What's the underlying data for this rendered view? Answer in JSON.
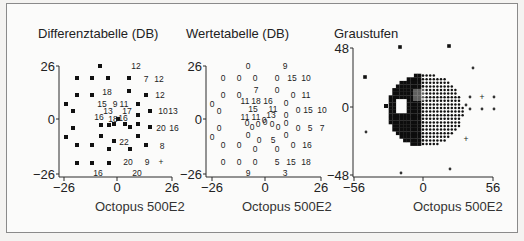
{
  "figure": {
    "panels": [
      {
        "title": "Differenztabelle (DB)",
        "footer": "Octopus 500E2"
      },
      {
        "title": "Wertetabelle (DB)",
        "footer": "Octopus 500E2"
      },
      {
        "title": "Graustufen",
        "footer": "Octopus 500E2"
      }
    ]
  },
  "chart_data": [
    {
      "type": "scatter",
      "title": "Differenztabelle (DB)",
      "xlabel": "Octopus 500E2",
      "ylabel": "",
      "xlim": [
        -26,
        26
      ],
      "ylim": [
        -26,
        26
      ],
      "x_ticks": [
        "-26",
        "0",
        "26"
      ],
      "y_ticks": [
        "26",
        "0",
        "-26"
      ],
      "grid": false,
      "legend": null,
      "description": "Perimetry difference table: filled squares mark points with defect symbols, numbers are deviation values in dB, '+' marks a point.",
      "labels": [
        {
          "text": "12",
          "px": 136,
          "py": 66
        },
        {
          "text": "7",
          "px": 146,
          "py": 79
        },
        {
          "text": "12",
          "px": 159,
          "py": 79
        },
        {
          "text": "18",
          "px": 107,
          "py": 92
        },
        {
          "text": "12",
          "px": 160,
          "py": 95
        },
        {
          "text": "15",
          "px": 102,
          "py": 104
        },
        {
          "text": "9",
          "px": 115,
          "py": 104
        },
        {
          "text": "11",
          "px": 124,
          "py": 104
        },
        {
          "text": "13",
          "px": 108,
          "py": 111
        },
        {
          "text": "17",
          "px": 127,
          "py": 111
        },
        {
          "text": "10",
          "px": 163,
          "py": 111
        },
        {
          "text": "13",
          "px": 173,
          "py": 111
        },
        {
          "text": "16",
          "px": 99,
          "py": 117
        },
        {
          "text": "18",
          "px": 113,
          "py": 119
        },
        {
          "text": "16",
          "px": 123,
          "py": 118
        },
        {
          "text": "20",
          "px": 161,
          "py": 128
        },
        {
          "text": "16",
          "px": 174,
          "py": 128
        },
        {
          "text": "22",
          "px": 124,
          "py": 142
        },
        {
          "text": "8",
          "px": 162,
          "py": 146
        },
        {
          "text": "20",
          "px": 128,
          "py": 162
        },
        {
          "text": "9",
          "px": 147,
          "py": 162
        },
        {
          "text": "+",
          "px": 161,
          "py": 162
        },
        {
          "text": "16",
          "px": 98,
          "py": 173
        },
        {
          "text": "20",
          "px": 137,
          "py": 173
        }
      ],
      "squares": [
        [
          100,
          66
        ],
        [
          77,
          78
        ],
        [
          92,
          78
        ],
        [
          108,
          78
        ],
        [
          129,
          78
        ],
        [
          77,
          95
        ],
        [
          92,
          95
        ],
        [
          129,
          91
        ],
        [
          146,
          95
        ],
        [
          66,
          104
        ],
        [
          138,
          104
        ],
        [
          73,
          111
        ],
        [
          150,
          111
        ],
        [
          138,
          115
        ],
        [
          118,
          119
        ],
        [
          101,
          125
        ],
        [
          109,
          125
        ],
        [
          114,
          124
        ],
        [
          125,
          124
        ],
        [
          130,
          127
        ],
        [
          138,
          124
        ],
        [
          150,
          127
        ],
        [
          73,
          128
        ],
        [
          66,
          137
        ],
        [
          101,
          136
        ],
        [
          114,
          141
        ],
        [
          138,
          136
        ],
        [
          77,
          145
        ],
        [
          92,
          145
        ],
        [
          109,
          149
        ],
        [
          130,
          149
        ],
        [
          146,
          145
        ],
        [
          77,
          163
        ],
        [
          92,
          163
        ],
        [
          109,
          163
        ]
      ]
    },
    {
      "type": "table",
      "title": "Wertetabelle (DB)",
      "xlabel": "Octopus 500E2",
      "ylabel": "",
      "xlim": [
        -26,
        26
      ],
      "ylim": [
        -26,
        26
      ],
      "x_ticks": [
        "-26",
        "0",
        "26"
      ],
      "y_ticks": [
        "26",
        "0",
        "-26"
      ],
      "grid": false,
      "legend": null,
      "description": "Perimetry threshold value table (dB) at each tested location.",
      "labels": [
        {
          "text": "0",
          "px": 248,
          "py": 66
        },
        {
          "text": "9",
          "px": 285,
          "py": 66
        },
        {
          "text": "0",
          "px": 223,
          "py": 78
        },
        {
          "text": "0",
          "px": 239,
          "py": 78
        },
        {
          "text": "0",
          "px": 255,
          "py": 78
        },
        {
          "text": "0",
          "px": 277,
          "py": 78
        },
        {
          "text": "15",
          "px": 292,
          "py": 78
        },
        {
          "text": "10",
          "px": 306,
          "py": 78
        },
        {
          "text": "0",
          "px": 223,
          "py": 95
        },
        {
          "text": "0",
          "px": 239,
          "py": 95
        },
        {
          "text": "7",
          "px": 256,
          "py": 90
        },
        {
          "text": "0",
          "px": 277,
          "py": 90
        },
        {
          "text": "0",
          "px": 293,
          "py": 95
        },
        {
          "text": "11",
          "px": 306,
          "py": 95
        },
        {
          "text": "0",
          "px": 212,
          "py": 104
        },
        {
          "text": "11",
          "px": 245,
          "py": 101
        },
        {
          "text": "18",
          "px": 256,
          "py": 101
        },
        {
          "text": "16",
          "px": 268,
          "py": 101
        },
        {
          "text": "0",
          "px": 286,
          "py": 103
        },
        {
          "text": "0",
          "px": 219,
          "py": 111
        },
        {
          "text": "15",
          "px": 253,
          "py": 109
        },
        {
          "text": "11",
          "px": 273,
          "py": 109
        },
        {
          "text": "0",
          "px": 298,
          "py": 110
        },
        {
          "text": "15",
          "px": 308,
          "py": 110
        },
        {
          "text": "10",
          "px": 322,
          "py": 110
        },
        {
          "text": "11",
          "px": 245,
          "py": 117
        },
        {
          "text": "11",
          "px": 256,
          "py": 117
        },
        {
          "text": "0",
          "px": 264,
          "py": 120
        },
        {
          "text": "13",
          "px": 271,
          "py": 115
        },
        {
          "text": "0",
          "px": 286,
          "py": 115
        },
        {
          "text": "0",
          "px": 247,
          "py": 123
        },
        {
          "text": "0",
          "px": 252,
          "py": 127
        },
        {
          "text": "0",
          "px": 258,
          "py": 124
        },
        {
          "text": "0",
          "px": 265,
          "py": 122
        },
        {
          "text": "0",
          "px": 272,
          "py": 124
        },
        {
          "text": "0",
          "px": 278,
          "py": 127
        },
        {
          "text": "0",
          "px": 286,
          "py": 123
        },
        {
          "text": "0",
          "px": 219,
          "py": 128
        },
        {
          "text": "0",
          "px": 298,
          "py": 128
        },
        {
          "text": "5",
          "px": 310,
          "py": 128
        },
        {
          "text": "7",
          "px": 322,
          "py": 128
        },
        {
          "text": "0",
          "px": 212,
          "py": 137
        },
        {
          "text": "0",
          "px": 248,
          "py": 135
        },
        {
          "text": "0",
          "px": 259,
          "py": 140
        },
        {
          "text": "5",
          "px": 273,
          "py": 140
        },
        {
          "text": "0",
          "px": 286,
          "py": 135
        },
        {
          "text": "0",
          "px": 223,
          "py": 145
        },
        {
          "text": "0",
          "px": 239,
          "py": 145
        },
        {
          "text": "0",
          "px": 255,
          "py": 149
        },
        {
          "text": "0",
          "px": 277,
          "py": 149
        },
        {
          "text": "0",
          "px": 293,
          "py": 145
        },
        {
          "text": "16",
          "px": 307,
          "py": 145
        },
        {
          "text": "0",
          "px": 223,
          "py": 162
        },
        {
          "text": "0",
          "px": 239,
          "py": 162
        },
        {
          "text": "0",
          "px": 255,
          "py": 162
        },
        {
          "text": "5",
          "px": 277,
          "py": 162
        },
        {
          "text": "15",
          "px": 291,
          "py": 162
        },
        {
          "text": "18",
          "px": 306,
          "py": 162
        },
        {
          "text": "9",
          "px": 248,
          "py": 173
        },
        {
          "text": "3",
          "px": 285,
          "py": 173
        }
      ]
    },
    {
      "type": "heatmap",
      "title": "Graustufen",
      "xlabel": "Octopus 500E2",
      "ylabel": "",
      "xlim": [
        -56,
        56
      ],
      "ylim": [
        -48,
        48
      ],
      "x_ticks": [
        "-56",
        "0",
        "56"
      ],
      "y_ticks": [
        "48",
        "0",
        "-48"
      ],
      "grid": false,
      "legend": null,
      "description": "Grayscale perimetry map: dense dark circular field, darker (solid) on left half, dotted on right half, small white square blind-spot region left of center, scattered outlier dots."
    }
  ]
}
